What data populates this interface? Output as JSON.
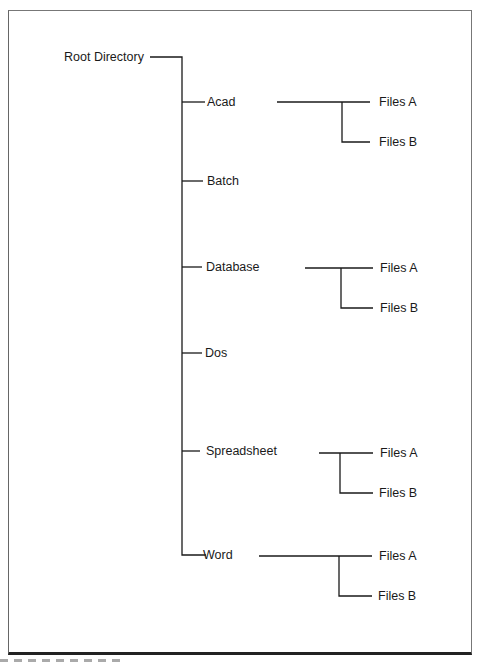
{
  "diagram": {
    "type": "directory-tree",
    "root": {
      "label": "Root Directory"
    },
    "children": [
      {
        "label": "Acad",
        "children": [
          {
            "label": "Files A"
          },
          {
            "label": "Files B"
          }
        ]
      },
      {
        "label": "Batch",
        "children": []
      },
      {
        "label": "Database",
        "children": [
          {
            "label": "Files A"
          },
          {
            "label": "Files B"
          }
        ]
      },
      {
        "label": "Dos",
        "children": []
      },
      {
        "label": "Spreadsheet",
        "children": [
          {
            "label": "Files A"
          },
          {
            "label": "Files B"
          }
        ]
      },
      {
        "label": "Word",
        "children": [
          {
            "label": "Files A"
          },
          {
            "label": "Files B"
          }
        ]
      }
    ]
  },
  "colors": {
    "line": "#1a1a1a",
    "frame": "#666666"
  }
}
